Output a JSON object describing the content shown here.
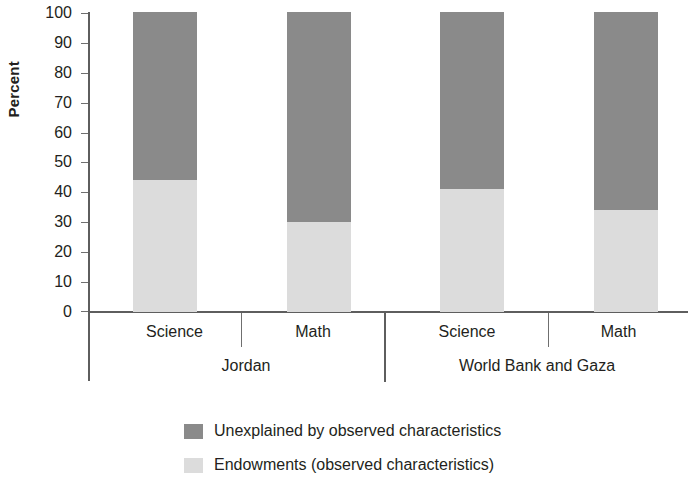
{
  "chart_data": {
    "type": "bar",
    "subtype": "stacked-bar-100-percent",
    "title": "",
    "xlabel": "",
    "ylabel": "Percent",
    "ylim": [
      0,
      100
    ],
    "yticks": [
      0,
      10,
      20,
      30,
      40,
      50,
      60,
      70,
      80,
      90,
      100
    ],
    "ytick_labels": [
      "0",
      "10",
      "20",
      "30",
      "40",
      "50",
      "60",
      "70",
      "80",
      "90",
      "100"
    ],
    "grid": false,
    "legend_position": "bottom",
    "categories": [
      "Science",
      "Math",
      "Science",
      "Math"
    ],
    "groups": [
      {
        "label": "Jordan",
        "categories": [
          "Science",
          "Math"
        ]
      },
      {
        "label": "World Bank and Gaza",
        "categories": [
          "Science",
          "Math"
        ]
      }
    ],
    "series": [
      {
        "name": "Unexplained by observed characteristics",
        "color": "#8a8a8a",
        "values": [
          56,
          70,
          59,
          66
        ]
      },
      {
        "name": "Endowments (observed characteristics)",
        "color": "#dcdcdc",
        "values": [
          44,
          30,
          41,
          34
        ]
      }
    ],
    "bars": [
      {
        "group": "Jordan",
        "category": "Science",
        "endowments": 44,
        "unexplained": 56
      },
      {
        "group": "Jordan",
        "category": "Math",
        "endowments": 30,
        "unexplained": 70
      },
      {
        "group": "World Bank and Gaza",
        "category": "Science",
        "endowments": 41,
        "unexplained": 59
      },
      {
        "group": "World Bank and Gaza",
        "category": "Math",
        "endowments": 34,
        "unexplained": 66
      }
    ],
    "annotations": []
  },
  "axis": {
    "y_title": "Percent",
    "y_ticks": [
      "100",
      "90",
      "80",
      "70",
      "60",
      "50",
      "40",
      "30",
      "20",
      "10",
      "0"
    ]
  },
  "categories": {
    "c0": "Science",
    "c1": "Math",
    "c2": "Science",
    "c3": "Math"
  },
  "groups": {
    "g0": "Jordan",
    "g1": "World Bank and Gaza"
  },
  "legend": {
    "items": [
      {
        "label": "Unexplained by observed characteristics",
        "color": "#8a8a8a"
      },
      {
        "label": "Endowments (observed characteristics)",
        "color": "#dcdcdc"
      }
    ]
  },
  "colors": {
    "unexplained": "#8a8a8a",
    "endowments": "#dcdcdc",
    "axis": "#5e5e5e",
    "text": "#231f20"
  }
}
